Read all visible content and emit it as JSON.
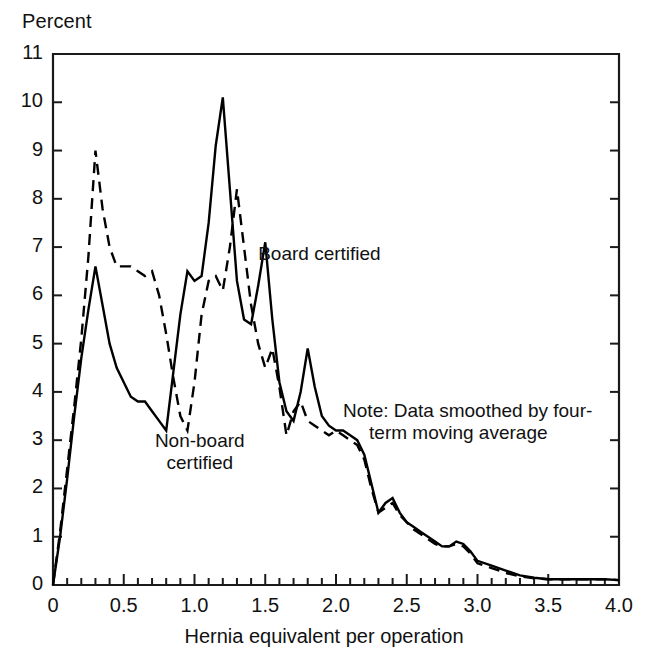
{
  "chart_data": {
    "type": "line",
    "title": "",
    "xlabel": "Hernia equivalent per operation",
    "ylabel": "Percent",
    "xlim": [
      0,
      4.0
    ],
    "ylim": [
      0,
      11
    ],
    "grid": false,
    "legend_position": "inline-annotations",
    "x_ticks": [
      "0",
      "0.5",
      "1.0",
      "1.5",
      "2.0",
      "2.5",
      "3.0",
      "3.5",
      "4.0"
    ],
    "x_tick_values": [
      0,
      0.5,
      1.0,
      1.5,
      2.0,
      2.5,
      3.0,
      3.5,
      4.0
    ],
    "x_minor_tick_step": 0.1,
    "y_ticks": [
      "0",
      "1",
      "2",
      "3",
      "4",
      "5",
      "6",
      "7",
      "8",
      "9",
      "10",
      "11"
    ],
    "y_tick_values": [
      0,
      1,
      2,
      3,
      4,
      5,
      6,
      7,
      8,
      9,
      10,
      11
    ],
    "x": [
      0.0,
      0.05,
      0.1,
      0.15,
      0.2,
      0.25,
      0.3,
      0.35,
      0.4,
      0.45,
      0.5,
      0.55,
      0.6,
      0.65,
      0.7,
      0.75,
      0.8,
      0.85,
      0.9,
      0.95,
      1.0,
      1.05,
      1.1,
      1.15,
      1.2,
      1.25,
      1.3,
      1.35,
      1.4,
      1.45,
      1.5,
      1.55,
      1.6,
      1.65,
      1.7,
      1.75,
      1.8,
      1.85,
      1.9,
      1.95,
      2.0,
      2.05,
      2.1,
      2.15,
      2.2,
      2.25,
      2.3,
      2.35,
      2.4,
      2.45,
      2.5,
      2.55,
      2.6,
      2.65,
      2.7,
      2.75,
      2.8,
      2.85,
      2.9,
      2.95,
      3.0,
      3.1,
      3.2,
      3.3,
      3.4,
      3.5,
      3.6,
      3.7,
      3.8,
      3.9,
      4.0
    ],
    "series": [
      {
        "name": "Board certified",
        "style": "solid",
        "color": "#000000",
        "values": [
          0.0,
          1.0,
          2.2,
          3.5,
          4.7,
          5.7,
          6.6,
          5.8,
          5.0,
          4.5,
          4.2,
          3.9,
          3.8,
          3.8,
          3.6,
          3.4,
          3.2,
          4.4,
          5.6,
          6.5,
          6.3,
          6.4,
          7.5,
          9.1,
          10.1,
          8.2,
          6.3,
          5.5,
          5.4,
          6.2,
          7.1,
          5.5,
          4.2,
          3.6,
          3.4,
          4.0,
          4.9,
          4.1,
          3.5,
          3.3,
          3.2,
          3.2,
          3.1,
          3.0,
          2.7,
          2.1,
          1.5,
          1.7,
          1.8,
          1.5,
          1.3,
          1.2,
          1.1,
          1.0,
          0.9,
          0.8,
          0.8,
          0.9,
          0.85,
          0.7,
          0.5,
          0.4,
          0.3,
          0.2,
          0.15,
          0.12,
          0.12,
          0.12,
          0.12,
          0.12,
          0.1
        ]
      },
      {
        "name": "Non-board certified",
        "style": "dashed",
        "color": "#000000",
        "values": [
          0.0,
          1.1,
          2.4,
          3.7,
          5.1,
          6.8,
          9.0,
          7.8,
          7.0,
          6.6,
          6.6,
          6.6,
          6.5,
          6.4,
          6.5,
          6.0,
          5.2,
          4.3,
          3.5,
          3.2,
          4.2,
          5.6,
          6.3,
          6.4,
          6.1,
          7.0,
          8.2,
          7.0,
          5.8,
          5.0,
          4.5,
          4.9,
          4.1,
          3.1,
          3.6,
          3.8,
          3.4,
          3.3,
          3.2,
          3.1,
          3.2,
          3.1,
          3.0,
          2.9,
          2.6,
          2.0,
          1.5,
          1.6,
          1.7,
          1.45,
          1.3,
          1.15,
          1.05,
          0.95,
          0.85,
          0.8,
          0.8,
          0.85,
          0.8,
          0.65,
          0.45,
          0.35,
          0.25,
          0.18,
          0.14,
          0.12,
          0.12,
          0.12,
          0.12,
          0.12,
          0.1
        ]
      }
    ],
    "annotations": [
      {
        "id": "board-certified-label",
        "text": "Board certified",
        "x": 1.45,
        "y": 6.8
      },
      {
        "id": "non-board-certified-label",
        "line1": "Non-board",
        "line2": "certified",
        "x": 0.72,
        "y": 3.05
      },
      {
        "id": "note",
        "line1": "Note: Data smoothed by four-",
        "line2": "term moving average",
        "x": 2.05,
        "y": 3.55
      }
    ]
  },
  "axis": {
    "y_title": "Percent",
    "x_title": "Hernia equivalent per operation"
  },
  "labels": {
    "board_certified": "Board certified",
    "non_board_certified_line1": "Non-board",
    "non_board_certified_line2": "certified",
    "note_line1": "Note: Data smoothed by four-",
    "note_line2": "term moving average"
  },
  "ticks": {
    "y": [
      "11",
      "10",
      "9",
      "8",
      "7",
      "6",
      "5",
      "4",
      "3",
      "2",
      "1",
      "0"
    ],
    "x": [
      "0",
      "0.5",
      "1.0",
      "1.5",
      "2.0",
      "2.5",
      "3.0",
      "3.5",
      "4.0"
    ]
  },
  "colors": {
    "line": "#000000",
    "axis": "#1a1a1a",
    "background": "#ffffff"
  }
}
